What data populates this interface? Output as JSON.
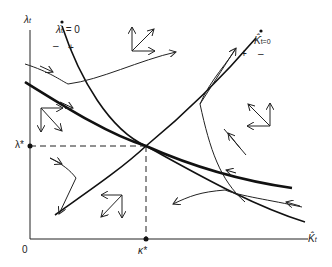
{
  "diagram": {
    "type": "phase-diagram",
    "axes": {
      "y_label": "λ",
      "y_label_sub": "t",
      "x_label": "K̂",
      "x_label_sub": "t",
      "origin_label": "0"
    },
    "equilibrium": {
      "lambda_label": "λ*",
      "k_label": "κ*"
    },
    "loci": [
      {
        "name": "lambda-dot-zero",
        "label": "λ̇",
        "label_sub": "t",
        "label_eq": "= 0",
        "minus": "–",
        "plus": "+"
      },
      {
        "name": "k-dot-zero",
        "label": "K̂̇",
        "label_sub": "t=0",
        "minus": "–",
        "plus": "+"
      }
    ],
    "colors": {
      "line": "#111111",
      "background": "#ffffff"
    }
  }
}
